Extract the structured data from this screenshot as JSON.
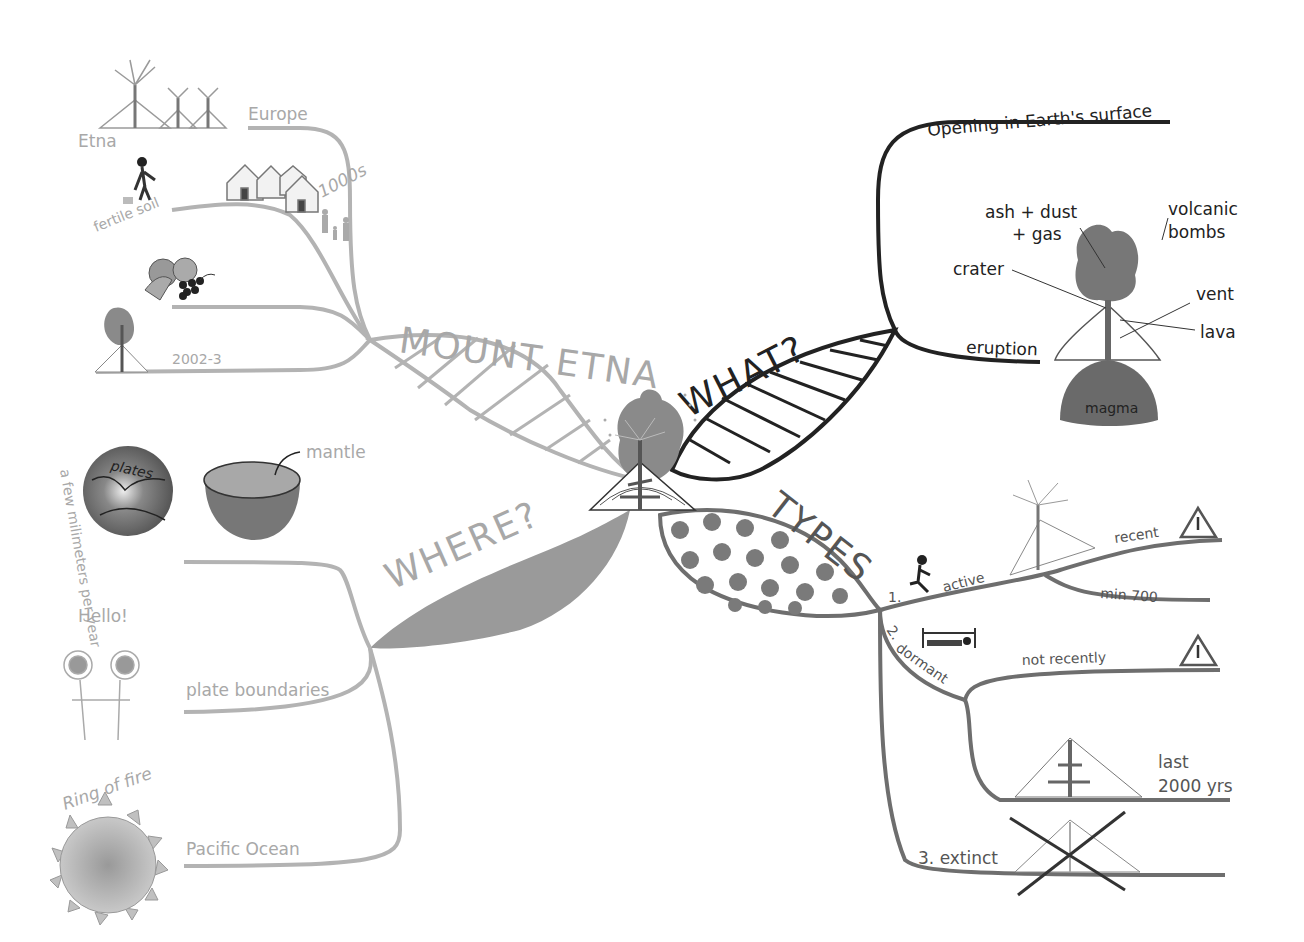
{
  "title": "MOUNT ETNA",
  "colors": {
    "light_branch": "#b3b3b3",
    "dark_branch": "#222222",
    "mid_branch": "#6e6e6e",
    "where_fill": "#9a9a9a",
    "magma_fill": "#6a6a6a",
    "dots": "#7a7a7a"
  },
  "branches": {
    "mount_etna": {
      "label": "MOUNT ETNA",
      "items": [
        {
          "label": "Europe",
          "note": "Etna"
        },
        {
          "label": "fertile soil",
          "note": "1000s"
        },
        {
          "label": "fruit"
        },
        {
          "label": "2002-3"
        }
      ]
    },
    "what": {
      "label": "WHAT?",
      "items": [
        {
          "label": "Opening in Earth's surface"
        },
        {
          "label": "eruption"
        }
      ],
      "diagram": {
        "ash": "ash + dust",
        "gas": "+ gas",
        "bombs1": "volcanic",
        "bombs2": "bombs",
        "crater": "crater",
        "vent": "vent",
        "lava": "lava",
        "magma": "magma"
      }
    },
    "where": {
      "label": "WHERE?",
      "items": [
        {
          "label": "plates",
          "note": "a few milimeters per year"
        },
        {
          "label": "mantle"
        },
        {
          "label": "plate boundaries",
          "note": "Hello!"
        },
        {
          "label": "Pacific Ocean",
          "note": "Ring of fire"
        }
      ]
    },
    "types": {
      "label": "TYPES",
      "items": [
        {
          "num": "1.",
          "label": "active",
          "sub": [
            "recent",
            "min 700"
          ]
        },
        {
          "num": "2.",
          "label": "dormant",
          "sub": [
            "not recently",
            "last",
            "2000 yrs"
          ]
        },
        {
          "num": "3.",
          "label": "extinct"
        }
      ]
    }
  }
}
